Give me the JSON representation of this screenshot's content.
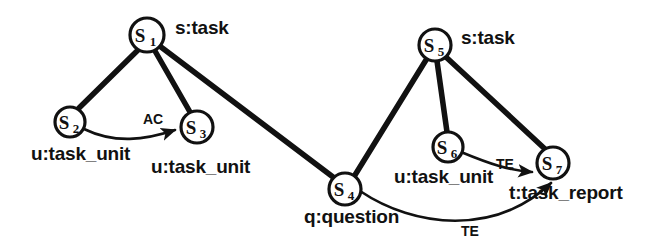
{
  "diagram": {
    "kind": "semantic-graph",
    "background_color": "#ffffff",
    "stroke_color": "#111111",
    "nodes": [
      {
        "id": "s1",
        "name": "S",
        "index": "1",
        "cx": 147,
        "cy": 35,
        "r": 17
      },
      {
        "id": "s2",
        "name": "S",
        "index": "2",
        "cx": 70,
        "cy": 122,
        "r": 15
      },
      {
        "id": "s3",
        "name": "S",
        "index": "3",
        "cx": 197,
        "cy": 127,
        "r": 16
      },
      {
        "id": "s4",
        "name": "S",
        "index": "4",
        "cx": 345,
        "cy": 189,
        "r": 16
      },
      {
        "id": "s5",
        "name": "S",
        "index": "5",
        "cx": 435,
        "cy": 45,
        "r": 16
      },
      {
        "id": "s6",
        "name": "S",
        "index": "6",
        "cx": 448,
        "cy": 147,
        "r": 15
      },
      {
        "id": "s7",
        "name": "S",
        "index": "7",
        "cx": 553,
        "cy": 163,
        "r": 16
      }
    ],
    "type_labels": [
      {
        "id": "t-s1",
        "text": "s:task",
        "x": 175,
        "y": 17
      },
      {
        "id": "t-s2",
        "text": "u:task_unit",
        "x": 31,
        "y": 143
      },
      {
        "id": "t-s3",
        "text": "u:task_unit",
        "x": 151,
        "y": 156
      },
      {
        "id": "t-s4",
        "text": "q:question",
        "x": 304,
        "y": 206
      },
      {
        "id": "t-s5",
        "text": "s:task",
        "x": 461,
        "y": 27
      },
      {
        "id": "t-s6",
        "text": "u:task_unit",
        "x": 394,
        "y": 166
      },
      {
        "id": "t-s7",
        "text": "t:task_report",
        "x": 509,
        "y": 182
      }
    ],
    "arc_labels": [
      {
        "id": "a-ac",
        "text": "AC",
        "x": 143,
        "y": 111
      },
      {
        "id": "a-te-1",
        "text": "TE",
        "x": 496,
        "y": 156
      },
      {
        "id": "a-te-2",
        "text": "TE",
        "x": 461,
        "y": 223
      }
    ],
    "edges": [
      {
        "id": "e-s1-s2",
        "from": "s1",
        "to": "s2",
        "style": "thick",
        "arrow": false
      },
      {
        "id": "e-s1-s3",
        "from": "s1",
        "to": "s3",
        "style": "thick",
        "arrow": false
      },
      {
        "id": "e-s1-s4",
        "from": "s1",
        "to": "s4",
        "style": "thick",
        "arrow": false
      },
      {
        "id": "e-s2-s3",
        "from": "s2",
        "to": "s3",
        "style": "thin",
        "arrow": true,
        "label": "AC"
      },
      {
        "id": "e-s5-s4",
        "from": "s5",
        "to": "s4",
        "style": "thick",
        "arrow": false
      },
      {
        "id": "e-s5-s6",
        "from": "s5",
        "to": "s6",
        "style": "thick",
        "arrow": false
      },
      {
        "id": "e-s5-s7",
        "from": "s5",
        "to": "s7",
        "style": "thick",
        "arrow": false
      },
      {
        "id": "e-s6-s7",
        "from": "s6",
        "to": "s7",
        "style": "thin",
        "arrow": true,
        "label": "TE"
      },
      {
        "id": "e-s4-s7",
        "from": "s4",
        "to": "s7",
        "style": "thin",
        "arrow": true,
        "label": "TE"
      }
    ]
  }
}
